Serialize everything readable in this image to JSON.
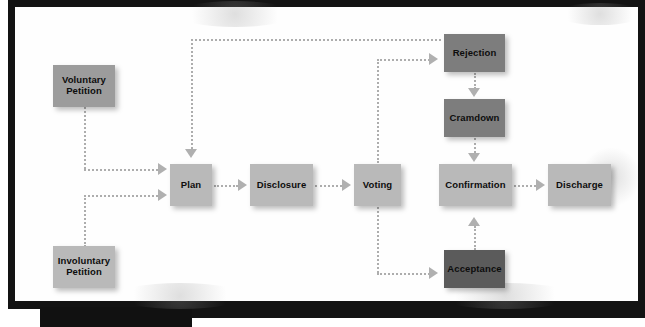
{
  "diagram": {
    "canvas_color": "#fefefe",
    "frame_color": "#131313",
    "connector_color": "#adadad",
    "arrowhead_color": "#b0b0b0",
    "caption_strip_text": "",
    "tones": {
      "light": "#b9b9b9",
      "medium": "#9c9c9c",
      "dark": "#7d7d7d",
      "darkest": "#5b5b5b"
    },
    "nodes": [
      {
        "id": "voluntary",
        "label": "Voluntary\nPetition",
        "line1": "Voluntary",
        "line2": "Petition",
        "tone": "medium",
        "x": 38,
        "y": 58,
        "w": 62,
        "h": 42
      },
      {
        "id": "involuntary",
        "label": "Involuntary\nPetition",
        "line1": "Involuntary",
        "line2": "Petition",
        "tone": "light",
        "x": 38,
        "y": 239,
        "w": 62,
        "h": 42
      },
      {
        "id": "plan",
        "label": "Plan",
        "line1": "Plan",
        "line2": "",
        "tone": "light",
        "x": 155,
        "y": 157,
        "w": 42,
        "h": 42
      },
      {
        "id": "disclosure",
        "label": "Disclosure",
        "line1": "Disclosure",
        "line2": "",
        "tone": "light",
        "x": 235,
        "y": 157,
        "w": 63,
        "h": 42
      },
      {
        "id": "voting",
        "label": "Voting",
        "line1": "Voting",
        "line2": "",
        "tone": "light",
        "x": 339,
        "y": 157,
        "w": 47,
        "h": 42
      },
      {
        "id": "confirmation",
        "label": "Confirmation",
        "line1": "Confirmation",
        "line2": "",
        "tone": "light",
        "x": 424,
        "y": 157,
        "w": 73,
        "h": 42
      },
      {
        "id": "discharge",
        "label": "Discharge",
        "line1": "Discharge",
        "line2": "",
        "tone": "light",
        "x": 533,
        "y": 157,
        "w": 63,
        "h": 42
      },
      {
        "id": "rejection",
        "label": "Rejection",
        "line1": "Rejection",
        "line2": "",
        "tone": "dark",
        "x": 429,
        "y": 27,
        "w": 61,
        "h": 38
      },
      {
        "id": "cramdown",
        "label": "Cramdown",
        "line1": "Cramdown",
        "line2": "",
        "tone": "dark",
        "x": 429,
        "y": 92,
        "w": 61,
        "h": 38
      },
      {
        "id": "acceptance",
        "label": "Acceptance",
        "line1": "Acceptance",
        "line2": "",
        "tone": "darkest",
        "x": 429,
        "y": 243,
        "w": 61,
        "h": 38
      }
    ],
    "edges": [
      {
        "from": "voluntary",
        "to": "plan",
        "style": "dotted",
        "path": "down-then-right"
      },
      {
        "from": "involuntary",
        "to": "plan",
        "style": "dotted",
        "path": "up-then-right"
      },
      {
        "from": "plan",
        "to": "disclosure",
        "style": "dotted",
        "path": "right"
      },
      {
        "from": "disclosure",
        "to": "voting",
        "style": "dotted",
        "path": "right"
      },
      {
        "from": "voting",
        "to": "rejection",
        "style": "dotted",
        "path": "up-then-right"
      },
      {
        "from": "voting",
        "to": "acceptance",
        "style": "dotted",
        "path": "down-then-right"
      },
      {
        "from": "rejection",
        "to": "plan",
        "style": "dotted",
        "path": "loop-left-then-down"
      },
      {
        "from": "rejection",
        "to": "cramdown",
        "style": "dotted",
        "path": "down"
      },
      {
        "from": "cramdown",
        "to": "confirmation",
        "style": "dotted",
        "path": "down"
      },
      {
        "from": "acceptance",
        "to": "confirmation",
        "style": "dotted",
        "path": "up"
      },
      {
        "from": "confirmation",
        "to": "discharge",
        "style": "dotted",
        "path": "right"
      }
    ]
  }
}
